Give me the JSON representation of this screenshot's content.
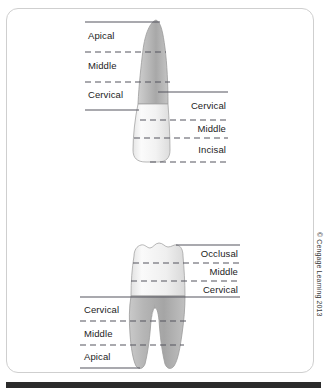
{
  "figure": {
    "copyright": "© Cengage Learning 2013",
    "colors": {
      "root_gray": "#b3b3b3",
      "crown_white": "#f3f3f3",
      "outline": "#8a8a8a",
      "rule": "#5a5a6a",
      "frame": "#cfcfcf",
      "text": "#1c1c1c"
    },
    "anterior_tooth": {
      "name": "anterior-incisor",
      "root_labels": [
        {
          "text": "Apical"
        },
        {
          "text": "Middle"
        },
        {
          "text": "Cervical"
        }
      ],
      "crown_labels": [
        {
          "text": "Cervical"
        },
        {
          "text": "Middle"
        },
        {
          "text": "Incisal"
        }
      ]
    },
    "posterior_tooth": {
      "name": "posterior-molar",
      "crown_labels": [
        {
          "text": "Occlusal"
        },
        {
          "text": "Middle"
        },
        {
          "text": "Cervical"
        }
      ],
      "root_labels": [
        {
          "text": "Cervical"
        },
        {
          "text": "Middle"
        },
        {
          "text": "Apical"
        }
      ]
    }
  }
}
